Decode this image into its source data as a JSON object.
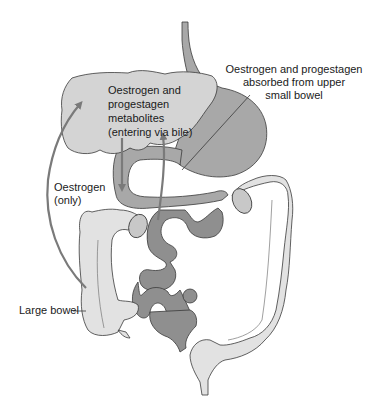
{
  "diagram": {
    "type": "anatomical-flow",
    "colors": {
      "liver": "#d4d4d4",
      "stomach_duodenum": "#a8a8a8",
      "small_intestine": "#8f8f8f",
      "large_bowel": "#e2e2e2",
      "arrows": "#7a7a7a",
      "outline": "#3a3a3a",
      "background": "#ffffff"
    },
    "labels": {
      "absorbed_line1": "Oestrogen and progestagen",
      "absorbed_line2": "absorbed from upper",
      "absorbed_line3": "small bowel",
      "metabolites_line1": "Oestrogen and",
      "metabolites_line2": "progestagen",
      "metabolites_line3": "metabolites",
      "metabolites_line4": "(entering via bile)",
      "oestrogen_only_line1": "Oestrogen",
      "oestrogen_only_line2": "(only)",
      "large_bowel": "Large bowel"
    },
    "organs": [
      "oesophagus",
      "liver",
      "stomach",
      "duodenum",
      "small intestine",
      "large bowel"
    ],
    "flows": [
      {
        "from": "liver",
        "to": "duodenum",
        "carries": "Oestrogen and progestagen metabolites (entering via bile)"
      },
      {
        "from": "upper small bowel",
        "to": "liver",
        "carries": "Oestrogen and progestagen absorbed"
      },
      {
        "from": "large bowel",
        "to": "liver",
        "carries": "Oestrogen (only)"
      }
    ]
  }
}
